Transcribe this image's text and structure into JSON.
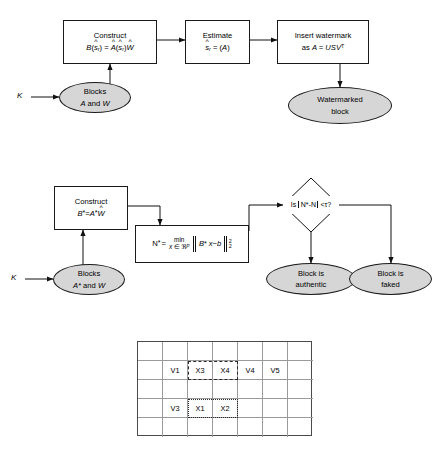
{
  "diagram": {
    "colors": {
      "node_fill": "#d6d6d6",
      "stroke": "#1a1a1a",
      "grid_line": "#9a9a9a",
      "grid_border": "#4a4a4a"
    }
  },
  "embedding": {
    "key_label": "K",
    "blocks_node": {
      "line1": "Blocks",
      "line2_a": "A",
      "line2_and": "and",
      "line2_b": "W"
    },
    "construct_box": {
      "line1": "Construct",
      "formula": "B(ŝ_r) = Â(ŝ_r)Ŵ",
      "lhs": "B",
      "lhs_arg": "ŝ",
      "lhs_sub": "r",
      "rhs_a": "A",
      "rhs_arg": "ŝ",
      "rhs_sub": "r",
      "rhs_w": "W",
      "eq": "=",
      "hat": "^"
    },
    "estimate_box": {
      "line1": "Estimate",
      "formula": "ŝ_r = (A)",
      "sym": "s",
      "sub": "r",
      "eq": "=",
      "arg": "(A)"
    },
    "insert_box": {
      "line1": "Insert watermark",
      "line2_pre": "as",
      "line2_eq": "A = USV",
      "line2_sup": "T"
    },
    "result_node": {
      "line1": "Watermarked",
      "line2": "block"
    }
  },
  "authentication": {
    "key_label": "K",
    "blocks_node": {
      "line1": "Blocks",
      "line2_a": "A*",
      "line2_and": "and",
      "line2_b": "W"
    },
    "construct_box": {
      "line1": "Construct",
      "lhs": "B*",
      "eq": "=",
      "rhs_a": "A*",
      "rhs_w": "W",
      "hat": "^"
    },
    "nstar_box": {
      "lhs": "N*",
      "eq": "=",
      "min_top": "min",
      "min_bottom_x": "x",
      "min_bottom_in": "∈",
      "min_bottom_set": "ℜ",
      "min_bottom_sup": "p",
      "norm_expr_b": "B*",
      "norm_expr_x": "x",
      "norm_expr_minus": "−",
      "norm_expr_bvec": "b",
      "norm_sup": "2",
      "norm_sub": "2"
    },
    "decision": {
      "text_pre": "Is",
      "text_abs": "N*-N",
      "text_post": "<τ?"
    },
    "authentic_node": {
      "line1": "Block is",
      "line2": "authentic"
    },
    "faked_node": {
      "line1": "Block is",
      "line2": "faked"
    }
  },
  "grid": {
    "columns": 7,
    "rows": 5,
    "cells": [
      [
        "",
        "",
        "",
        "",
        "",
        "",
        ""
      ],
      [
        "",
        "V1",
        "X3",
        "X4",
        "V4",
        "V5",
        ""
      ],
      [
        "",
        "",
        "",
        "",
        "",
        "",
        ""
      ],
      [
        "",
        "V3",
        "X1",
        "X2",
        "",
        "",
        ""
      ],
      [
        "",
        "",
        "",
        "",
        "",
        "",
        ""
      ]
    ],
    "dashed_region_label": "X3-X4",
    "dotted_region_label": "X1-X2"
  }
}
